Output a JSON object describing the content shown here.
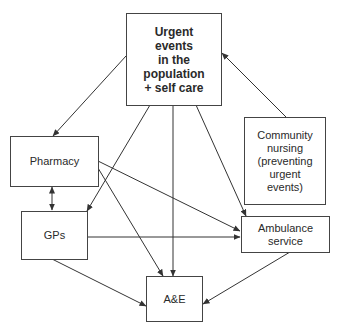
{
  "diagram": {
    "nodes": [
      {
        "id": "urgent",
        "label": "Urgent\nevents\nin the\npopulation\n+ self care",
        "bold": true
      },
      {
        "id": "pharmacy",
        "label": "Pharmacy"
      },
      {
        "id": "gps",
        "label": "GPs"
      },
      {
        "id": "community",
        "label": "Community\nnursing\n(preventing\nurgent\nevents)"
      },
      {
        "id": "ambulance",
        "label": "Ambulance\nservice"
      },
      {
        "id": "ae",
        "label": "A&E"
      }
    ],
    "edges": [
      {
        "from": "urgent",
        "to": "pharmacy"
      },
      {
        "from": "urgent",
        "to": "gps"
      },
      {
        "from": "urgent",
        "to": "ae"
      },
      {
        "from": "urgent",
        "to": "ambulance"
      },
      {
        "from": "community",
        "to": "urgent"
      },
      {
        "from": "pharmacy",
        "to": "gps",
        "bidirectional": true
      },
      {
        "from": "pharmacy",
        "to": "ambulance"
      },
      {
        "from": "pharmacy",
        "to": "ae"
      },
      {
        "from": "gps",
        "to": "ambulance"
      },
      {
        "from": "gps",
        "to": "ae"
      },
      {
        "from": "ambulance",
        "to": "ae"
      }
    ]
  }
}
